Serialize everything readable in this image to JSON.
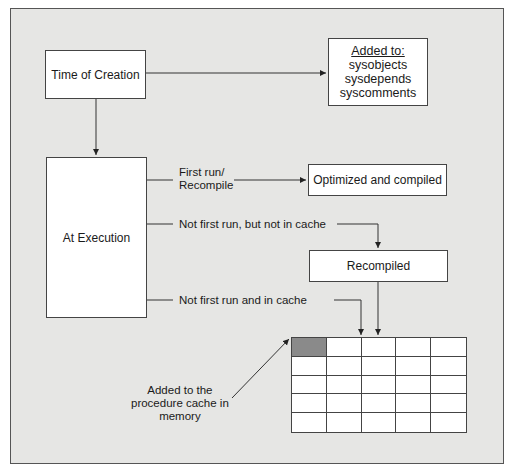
{
  "diagram": {
    "colors": {
      "panel_bg": "#e6e6e4",
      "box_bg": "#ffffff",
      "line": "#333333",
      "shaded_cell": "#8a8a8a"
    },
    "nodes": {
      "time_of_creation": "Time of Creation",
      "added_to": {
        "heading": "Added to:",
        "items": [
          "sysobjects",
          "sysdepends",
          "syscomments"
        ]
      },
      "at_execution": "At Execution",
      "optimized_compiled": "Optimized and compiled",
      "recompiled": "Recompiled",
      "procedure_cache_note": [
        "Added to the",
        "procedure cache in",
        "memory"
      ]
    },
    "edges": {
      "first_run": [
        "First run/",
        "Recompile"
      ],
      "not_first_not_cache": "Not first run, but not in cache",
      "not_first_in_cache": "Not first run and in cache"
    },
    "cache_grid": {
      "rows": 5,
      "columns": 5,
      "shaded_cell": [
        0,
        0
      ]
    }
  }
}
